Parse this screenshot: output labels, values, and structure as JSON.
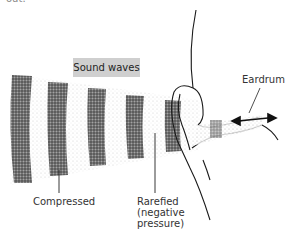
{
  "caption_fragment": "out.",
  "diagram": {
    "title": "Sound waves",
    "labels": {
      "eardrum": "Eardrum",
      "compressed": "Compressed",
      "rarefied": "Rarefied\n(negative\npressure)"
    },
    "wave_bands": [
      {
        "x": 12,
        "y": 75,
        "w": 20,
        "h": 108
      },
      {
        "x": 48,
        "y": 82,
        "w": 20,
        "h": 94
      },
      {
        "x": 88,
        "y": 88,
        "w": 18,
        "h": 78
      },
      {
        "x": 126,
        "y": 95,
        "w": 18,
        "h": 64
      },
      {
        "x": 165,
        "y": 100,
        "w": 16,
        "h": 52
      }
    ],
    "colors": {
      "band": "#3a3a3a",
      "label_box": "#cfcfcf",
      "ink": "#1a1a1a"
    }
  }
}
